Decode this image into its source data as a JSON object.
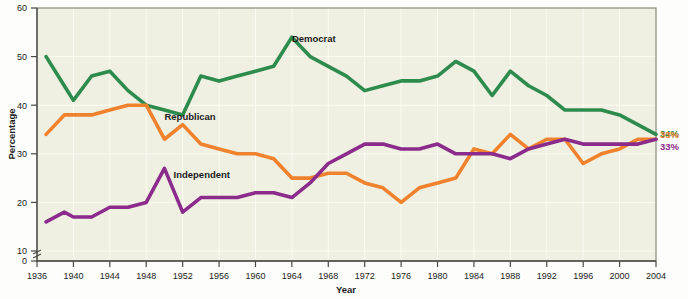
{
  "chart_data": {
    "type": "line",
    "title": "",
    "xlabel": "Year",
    "ylabel": "Percentage",
    "xlim": [
      1936,
      2004
    ],
    "ylim": [
      0,
      60
    ],
    "y_ticks": [
      0,
      10,
      20,
      30,
      40,
      50,
      60
    ],
    "y_axis_break": true,
    "x_ticks": [
      1936,
      1940,
      1944,
      1948,
      1952,
      1956,
      1960,
      1964,
      1968,
      1972,
      1976,
      1980,
      1984,
      1988,
      1992,
      1996,
      2000,
      2004
    ],
    "grid": true,
    "legend_position": "inline-annotations",
    "series": [
      {
        "name": "Democrat",
        "color": "#2d8b4e",
        "label_text": "Democrat",
        "end_label": "34%",
        "x": [
          1937,
          1939,
          1940,
          1942,
          1944,
          1946,
          1948,
          1950,
          1952,
          1954,
          1956,
          1958,
          1960,
          1962,
          1964,
          1966,
          1968,
          1970,
          1972,
          1974,
          1976,
          1978,
          1980,
          1982,
          1984,
          1986,
          1988,
          1990,
          1992,
          1994,
          1996,
          1998,
          2000,
          2002,
          2004
        ],
        "values": [
          50,
          44,
          41,
          46,
          47,
          43,
          40,
          39,
          38,
          46,
          45,
          46,
          47,
          48,
          54,
          50,
          48,
          46,
          43,
          44,
          45,
          45,
          46,
          49,
          47,
          42,
          47,
          44,
          42,
          39,
          39,
          39,
          38,
          36,
          34
        ]
      },
      {
        "name": "Republican",
        "color": "#f0822e",
        "label_text": "Republican",
        "end_label": "33%",
        "x": [
          1937,
          1939,
          1940,
          1942,
          1944,
          1946,
          1948,
          1950,
          1952,
          1954,
          1956,
          1958,
          1960,
          1962,
          1964,
          1966,
          1968,
          1970,
          1972,
          1974,
          1976,
          1978,
          1980,
          1982,
          1984,
          1986,
          1988,
          1990,
          1992,
          1994,
          1996,
          1998,
          2000,
          2002,
          2004
        ],
        "values": [
          34,
          38,
          38,
          38,
          39,
          40,
          40,
          33,
          36,
          32,
          31,
          30,
          30,
          29,
          25,
          25,
          26,
          26,
          24,
          23,
          20,
          23,
          24,
          25,
          31,
          30,
          34,
          31,
          33,
          33,
          28,
          30,
          31,
          33,
          33
        ]
      },
      {
        "name": "Independent",
        "color": "#8b2b8b",
        "label_text": "Independent",
        "end_label": "33%",
        "x": [
          1937,
          1939,
          1940,
          1942,
          1944,
          1946,
          1948,
          1950,
          1952,
          1954,
          1956,
          1958,
          1960,
          1962,
          1964,
          1966,
          1968,
          1970,
          1972,
          1974,
          1976,
          1978,
          1980,
          1982,
          1984,
          1986,
          1988,
          1990,
          1992,
          1994,
          1996,
          1998,
          2000,
          2002,
          2004
        ],
        "values": [
          16,
          18,
          17,
          17,
          19,
          19,
          20,
          27,
          18,
          21,
          21,
          21,
          22,
          22,
          21,
          24,
          28,
          30,
          32,
          32,
          31,
          31,
          32,
          30,
          30,
          30,
          29,
          31,
          32,
          33,
          32,
          32,
          32,
          32,
          33
        ]
      }
    ],
    "annotations": [
      {
        "text": "Democrat",
        "x": 1964,
        "y": 53,
        "color": "#1c1c1c"
      },
      {
        "text": "Republican",
        "x": 1950,
        "y": 37,
        "color": "#1c1c1c"
      },
      {
        "text": "Independent",
        "x": 1951,
        "y": 25,
        "color": "#1c1c1c"
      }
    ]
  },
  "colors": {
    "democrat": "#2d8b4e",
    "republican": "#f0822e",
    "independent": "#8b2b8b",
    "plot_background": "#eff0e1",
    "page_background": "#fdfdfb",
    "axis": "#4a4a44",
    "text": "#1c1c1c"
  }
}
